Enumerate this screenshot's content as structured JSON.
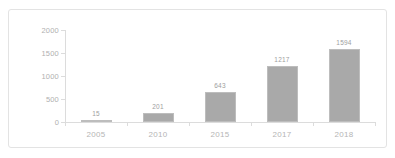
{
  "chart_data": {
    "type": "bar",
    "title": "",
    "xlabel": "",
    "ylabel": "",
    "categories": [
      "2005",
      "2010",
      "2015",
      "2017",
      "2018"
    ],
    "values": [
      15,
      201,
      643,
      1217,
      1594
    ],
    "data_labels": [
      "15",
      "201",
      "643",
      "1217",
      "1594"
    ],
    "ylim": [
      0,
      2000
    ],
    "ytick_labels": [
      "2000",
      "1500",
      "1000",
      "500",
      "0"
    ],
    "ytick_values": [
      2000,
      1500,
      1000,
      500,
      0
    ],
    "grid": false,
    "legend": false,
    "series": [
      {
        "name": "",
        "values": [
          15,
          201,
          643,
          1217,
          1594
        ]
      }
    ],
    "colors": {
      "bar_fill": "#a9a9a9",
      "bar_edge": "#bdbdbd",
      "axis": "#dcdcdc",
      "tick_text": "#b0b0b0",
      "category_text": "#b5b5b5",
      "data_label_text": "#9e9e9e",
      "frame_border": "#e3e3e3",
      "background": "#ffffff"
    }
  }
}
